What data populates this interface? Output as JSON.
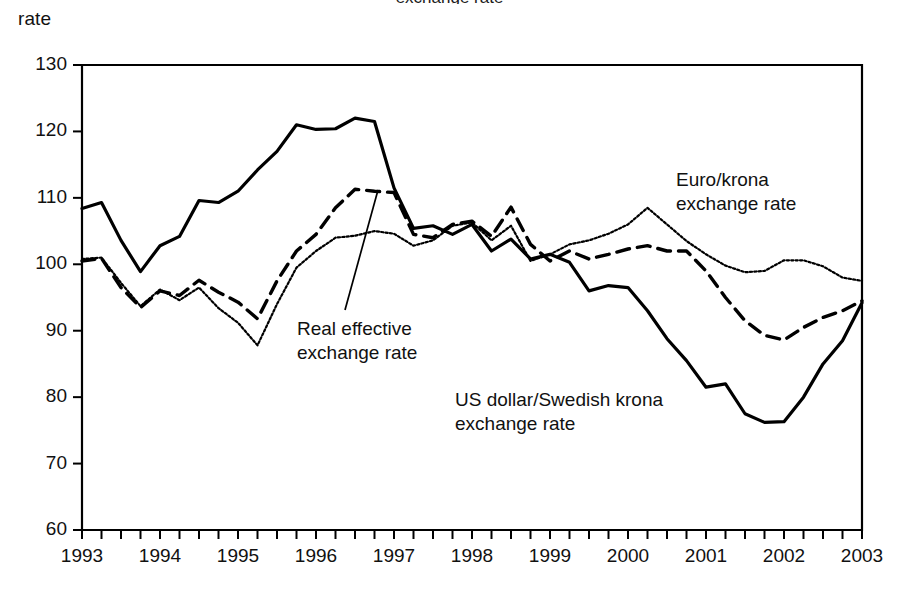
{
  "page": {
    "clipped_title": "exchange rate",
    "y_axis_caption": "rate"
  },
  "chart_data": {
    "type": "line",
    "title": "",
    "xlabel": "",
    "ylabel": "rate",
    "ylim": [
      60,
      130
    ],
    "xlim": [
      1993.0,
      2003.0
    ],
    "yticks": [
      130,
      120,
      110,
      100,
      90,
      80,
      70,
      60
    ],
    "xticks": [
      1993,
      1994,
      1995,
      1996,
      1997,
      1998,
      1999,
      2000,
      2001,
      2002,
      2003
    ],
    "minor_ticks_per_year": 4,
    "grid": false,
    "legend_position": "inline-annotations",
    "annotations": [
      {
        "name": "euro-krona-label",
        "text": "Euro/krona\nexchange rate",
        "x_px": 676,
        "y_px": 168,
        "leader": null
      },
      {
        "name": "real-effective-label",
        "text": "Real effective\nexchange rate",
        "x_px": 297,
        "y_px": 317,
        "leader": {
          "x1_px": 345,
          "y1_px": 310,
          "x2_px": 378,
          "y2_px": 190
        }
      },
      {
        "name": "us-dollar-krona-label",
        "text": "US dollar/Swedish krona\nexchange rate",
        "x_px": 455,
        "y_px": 388,
        "leader": null
      }
    ],
    "x": [
      1993.0,
      1993.25,
      1993.5,
      1993.75,
      1994.0,
      1994.25,
      1994.5,
      1994.75,
      1995.0,
      1995.25,
      1995.5,
      1995.75,
      1996.0,
      1996.25,
      1996.5,
      1996.75,
      1997.0,
      1997.25,
      1997.5,
      1997.75,
      1998.0,
      1998.25,
      1998.5,
      1998.75,
      1999.0,
      1999.25,
      1999.5,
      1999.75,
      2000.0,
      2000.25,
      2000.5,
      2000.75,
      2001.0,
      2001.25,
      2001.5,
      2001.75,
      2002.0,
      2002.25,
      2002.5,
      2002.75,
      2003.0
    ],
    "series": [
      {
        "name": "US dollar/Swedish krona exchange rate",
        "style": "solid",
        "color": "#000000",
        "values": [
          108.4,
          109.3,
          103.6,
          98.9,
          102.8,
          104.2,
          109.6,
          109.3,
          111.0,
          114.2,
          117.0,
          121.0,
          120.3,
          120.4,
          122.0,
          121.5,
          111.5,
          105.4,
          105.8,
          104.5,
          106.0,
          102.0,
          103.8,
          100.8,
          101.5,
          100.3,
          96.0,
          96.8,
          96.5,
          93.0,
          88.8,
          85.5,
          81.5,
          82.0,
          77.5,
          76.2,
          76.3,
          80.0,
          85.0,
          88.5,
          94.2
        ]
      },
      {
        "name": "Real effective exchange rate",
        "style": "dashed",
        "color": "#000000",
        "values": [
          100.5,
          100.9,
          96.5,
          93.5,
          96.0,
          95.3,
          97.6,
          95.8,
          94.3,
          91.8,
          97.5,
          102.0,
          104.5,
          108.5,
          111.3,
          111.0,
          110.8,
          104.5,
          104.0,
          106.0,
          106.5,
          104.2,
          108.6,
          103.0,
          100.5,
          102.0,
          100.8,
          101.5,
          102.3,
          102.8,
          102.0,
          102.0,
          99.0,
          95.0,
          91.5,
          89.3,
          88.6,
          90.5,
          92.0,
          93.0,
          94.5
        ]
      },
      {
        "name": "Euro/krona exchange rate",
        "style": "dotted",
        "color": "#000000",
        "values": [
          100.8,
          101.0,
          97.2,
          93.7,
          96.2,
          94.6,
          96.5,
          93.4,
          91.2,
          87.8,
          94.0,
          99.5,
          102.0,
          104.0,
          104.3,
          105.0,
          104.6,
          102.8,
          103.6,
          105.8,
          106.3,
          103.6,
          105.8,
          100.5,
          101.5,
          103.0,
          103.6,
          104.6,
          106.0,
          108.5,
          106.0,
          103.5,
          101.5,
          99.8,
          98.8,
          99.0,
          100.6,
          100.6,
          99.7,
          98.0,
          97.5
        ]
      }
    ]
  }
}
